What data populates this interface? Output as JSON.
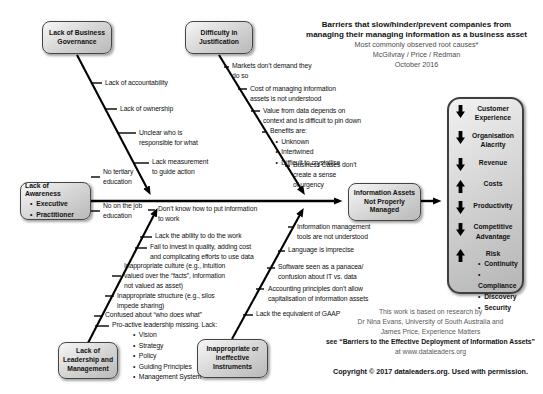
{
  "title": {
    "line1": "Barriers that slow/hinder/prevent companies from",
    "line2": "managing their managing information as a business asset",
    "line3": "Most commonly observed root causes*",
    "line4": "McGilvray / Price / Redman",
    "line5": "October 2016"
  },
  "cause_boxes": {
    "governance": "Lack of Business\nGovernance",
    "justification": "Difficulty in\nJustification",
    "awareness_title": "Lack of Awareness",
    "awareness_bullets": "•  Executive\n•  Practitioner",
    "leadership": "Lack of\nLeadership and\nManagement",
    "instruments": "Inappropriate or\nineffective\nInstruments"
  },
  "effect_box": "Information Assets\nNot Properly\nManaged",
  "bones": {
    "governance": [
      "Lack of accountability",
      "Lack of ownership",
      "Unclear who is\nresponsible for what",
      "Lack measurement\nto guide action"
    ],
    "awareness": [
      "No tertiary\neducation",
      "No on the job\neducation"
    ],
    "justification": [
      "Markets don’t demand they\ndo so",
      "Cost of managing information\nassets is not understood",
      "Value from data depends on\ncontext and is difficult to pin down",
      "Benefits are:\n   •  Unknown\n   •  Intertwined\n   •  Difficult to crystallise",
      "Business Cases don’t\ncreate a sense\nof urgency"
    ],
    "leadership": [
      "Don’t know how to put information\nto work",
      "Lack the ability to do the work",
      "Fail to invest in quality, adding cost\nand complicating efforts to use data",
      "Inappropriate culture (e.g., intuition\nvalued over the “facts”, information\nnot valued as asset)",
      "Inappropriate structure (e.g., silos\nimpede sharing)",
      "Confused about “who does what”",
      "Pro-active leadership missing. Lack:"
    ],
    "leadership_bullets": "•  Vision\n•  Strategy\n•  Policy\n•  Guiding Principles\n•  Management System",
    "instruments": [
      "Information management\ntools are not understood",
      "Language is imprecise",
      "Software seen as a panacea/\nconfusion about IT vs. data",
      "Accounting principles don’t allow\ncapitalisation of information assets",
      "Lack the equivalent of GAAP"
    ]
  },
  "outcomes": {
    "items": [
      {
        "dir": "down",
        "label": "Customer\nExperience"
      },
      {
        "dir": "down",
        "label": "Organisation\nAlacrity"
      },
      {
        "dir": "down",
        "label": "Revenue"
      },
      {
        "dir": "up",
        "label": "Costs"
      },
      {
        "dir": "down",
        "label": "Productivity"
      },
      {
        "dir": "down",
        "label": "Competitive\nAdvantage"
      },
      {
        "dir": "up",
        "label": "Risk",
        "bullets": "•  Continuity\n•  Compliance\n•  Discovery\n•  Security"
      }
    ]
  },
  "credit": {
    "line1": "This work is based on research by",
    "line2": "Dr Nina Evans, University of South Australia and",
    "line3": "James Price, Experience Matters",
    "line4": "see “Barriers to the Effective Deployment of Information Assets”",
    "line5": "at www.dataleaders.org"
  },
  "copyright": "Copyright © 2017 dataleaders.org. Used with permission.",
  "colors": {
    "box_fill_light": "#f7f7f7",
    "box_fill_dark": "#b9b9b9",
    "box_border": "#454545",
    "line": "#000000",
    "text": "#111111",
    "muted_text": "#595959"
  }
}
